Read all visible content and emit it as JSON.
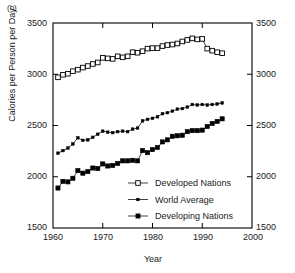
{
  "figure": {
    "panel_label": "(b)",
    "accent_color": "#000000",
    "background": "#ffffff"
  },
  "chart_data": {
    "type": "line",
    "title": "",
    "panel": "(b)",
    "xlabel": "Year",
    "ylabel": "Calories per Person per Day",
    "xlim": [
      1960,
      2000
    ],
    "ylim": [
      1500,
      3500
    ],
    "xticks": [
      1960,
      1970,
      1980,
      1990,
      2000
    ],
    "yticks": [
      1500,
      2000,
      2500,
      3000,
      3500
    ],
    "yticks_right": [
      1500,
      2000,
      2500,
      3000,
      3500
    ],
    "grid": false,
    "legend_position": "lower right inside",
    "series": [
      {
        "name": "Developed Nations",
        "marker": "open-square",
        "x": [
          1961,
          1962,
          1963,
          1964,
          1965,
          1966,
          1967,
          1968,
          1969,
          1970,
          1971,
          1972,
          1973,
          1974,
          1975,
          1976,
          1977,
          1978,
          1979,
          1980,
          1981,
          1982,
          1983,
          1984,
          1985,
          1986,
          1987,
          1988,
          1989,
          1990,
          1991,
          1992,
          1993,
          1994
        ],
        "values": [
          2970,
          2995,
          3005,
          3030,
          3045,
          3065,
          3080,
          3100,
          3115,
          3160,
          3155,
          3150,
          3175,
          3165,
          3175,
          3215,
          3210,
          3225,
          3250,
          3255,
          3255,
          3275,
          3285,
          3290,
          3300,
          3320,
          3335,
          3350,
          3340,
          3345,
          3250,
          3230,
          3215,
          3205
        ]
      },
      {
        "name": "World Average",
        "marker": "small-filled-square",
        "x": [
          1961,
          1962,
          1963,
          1964,
          1965,
          1966,
          1967,
          1968,
          1969,
          1970,
          1971,
          1972,
          1973,
          1974,
          1975,
          1976,
          1977,
          1978,
          1979,
          1980,
          1981,
          1982,
          1983,
          1984,
          1985,
          1986,
          1987,
          1988,
          1989,
          1990,
          1991,
          1992,
          1993,
          1994
        ],
        "values": [
          2230,
          2255,
          2280,
          2320,
          2380,
          2355,
          2360,
          2385,
          2415,
          2445,
          2435,
          2430,
          2440,
          2445,
          2440,
          2465,
          2475,
          2545,
          2560,
          2570,
          2585,
          2615,
          2625,
          2640,
          2660,
          2665,
          2680,
          2705,
          2700,
          2705,
          2700,
          2705,
          2710,
          2720
        ]
      },
      {
        "name": "Developing Nations",
        "marker": "filled-square",
        "x": [
          1961,
          1962,
          1963,
          1964,
          1965,
          1966,
          1967,
          1968,
          1969,
          1970,
          1971,
          1972,
          1973,
          1974,
          1975,
          1976,
          1977,
          1978,
          1979,
          1980,
          1981,
          1982,
          1983,
          1984,
          1985,
          1986,
          1987,
          1988,
          1989,
          1990,
          1991,
          1992,
          1993,
          1994
        ],
        "values": [
          1890,
          1955,
          1950,
          1985,
          2060,
          2035,
          2050,
          2085,
          2080,
          2125,
          2105,
          2110,
          2130,
          2155,
          2155,
          2160,
          2155,
          2255,
          2235,
          2265,
          2285,
          2340,
          2360,
          2395,
          2400,
          2405,
          2440,
          2450,
          2450,
          2455,
          2490,
          2520,
          2540,
          2565
        ]
      }
    ]
  },
  "legend": {
    "items": [
      {
        "label": "Developed Nations",
        "marker": "open-square"
      },
      {
        "label": "World Average",
        "marker": "small-filled-square"
      },
      {
        "label": "Developing Nations",
        "marker": "filled-square"
      }
    ]
  },
  "axes": {
    "left_ticks": [
      "3500",
      "3000",
      "2500",
      "2000",
      "1500"
    ],
    "right_ticks": [
      "3500",
      "3000",
      "2500",
      "2000",
      "1500"
    ],
    "x_ticks": [
      "1960",
      "1970",
      "1980",
      "1990",
      "2000"
    ]
  }
}
